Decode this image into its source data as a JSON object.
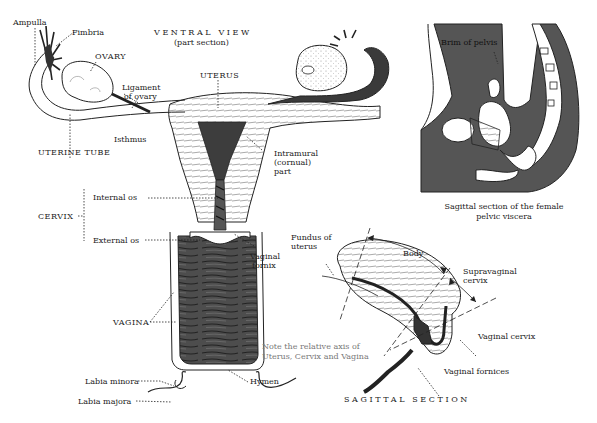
{
  "main_view": {
    "title": "VENTRAL VIEW",
    "subtitle": "(part section)",
    "labels": {
      "ampulla": "Ampulla",
      "fimbria": "Fimbria",
      "ovary": "OVARY",
      "ligament_of_ovary_1": "Ligament",
      "ligament_of_ovary_2": "of ovary",
      "uterus": "UTERUS",
      "isthmus": "Isthmus",
      "uterine_tube": "UTERINE TUBE",
      "intramural_1": "Intramural",
      "intramural_2": "(cornual)",
      "intramural_3": "part",
      "internal_os": "Internal os",
      "cervix": "CERVIX",
      "external_os": "External os",
      "vaginal_fornix_1": "Vaginal",
      "vaginal_fornix_2": "fornix",
      "vagina": "VAGINA",
      "hymen": "Hymen",
      "labia_minora": "Labia minora",
      "labia_majora": "Labia majora"
    }
  },
  "pelvis_view": {
    "label_brim": "Brim of pelvis",
    "caption_1": "Sagittal  section of the female",
    "caption_2": "pelvic viscera"
  },
  "sagittal_view": {
    "title": "SAGITTAL SECTION",
    "note_1": "Note the relative axis of",
    "note_2": "Uterus, Cervix and Vagina",
    "labels": {
      "fundus_1": "Fundus  of",
      "fundus_2": "uterus",
      "body": "Body",
      "supravaginal_1": "Supravaginal",
      "supravaginal_2": "cervix",
      "vaginal_cervix": "Vaginal  cervix",
      "vaginal_fornices": "Vaginal  fornices"
    }
  },
  "colors": {
    "ink": "#222222",
    "dark_tissue": "#4a4a4a",
    "pelvis_fill": "#555555",
    "note_text": "#777777"
  }
}
